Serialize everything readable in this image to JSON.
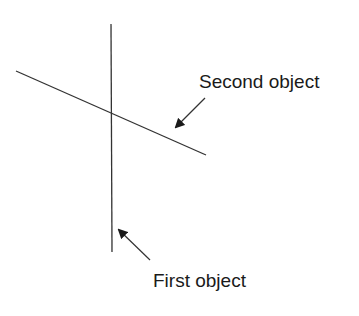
{
  "diagram": {
    "objects": [
      {
        "id": "first",
        "label": "First object",
        "shape": "line",
        "orientation": "vertical",
        "from": [
          111,
          24
        ],
        "to": [
          112,
          252
        ]
      },
      {
        "id": "second",
        "label": "Second object",
        "shape": "line",
        "orientation": "diagonal",
        "from": [
          16,
          71
        ],
        "to": [
          206,
          155
        ]
      }
    ],
    "intersection": [
      111,
      114
    ],
    "labels": {
      "first": "First object",
      "second": "Second object"
    },
    "arrows": [
      {
        "target": "first",
        "from": [
          150,
          260
        ],
        "to": [
          119,
          230
        ]
      },
      {
        "target": "second",
        "from": [
          205,
          98
        ],
        "to": [
          176,
          127
        ]
      }
    ],
    "colors": {
      "line": "#333333",
      "text": "#1a1a1a",
      "background": "#ffffff"
    }
  }
}
